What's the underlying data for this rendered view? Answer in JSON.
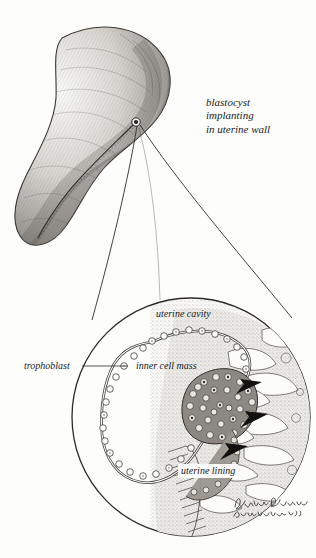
{
  "figure": {
    "domain": "medical-illustration",
    "subject": "blastocyst implanting in uterine wall",
    "medium": "graphite pencil drawing",
    "background_color": "#fdfdfc",
    "ink_color": "#1a1a1a"
  },
  "caption": {
    "line1": "blastocyst",
    "line2": "implanting",
    "line3": "in uterine wall"
  },
  "labels": {
    "uterine_cavity": "uterine cavity",
    "trophoblast": "trophoblast",
    "inner_cell_mass": "inner cell mass",
    "uterine_lining": "uterine lining"
  },
  "signature": {
    "name": "Paula DiSanto",
    "second_line": "Bensadoun '92"
  },
  "panels": {
    "overview": {
      "name": "uterus-sagittal-view",
      "description": "shaded uterus with implantation site marked",
      "implantation_marker": true
    },
    "detail": {
      "name": "magnified-implantation-circle",
      "shape": "circle",
      "arrow_count": 3,
      "arrow_direction": "left",
      "structures": [
        "uterine cavity",
        "trophoblast",
        "inner cell mass",
        "uterine lining"
      ]
    }
  }
}
